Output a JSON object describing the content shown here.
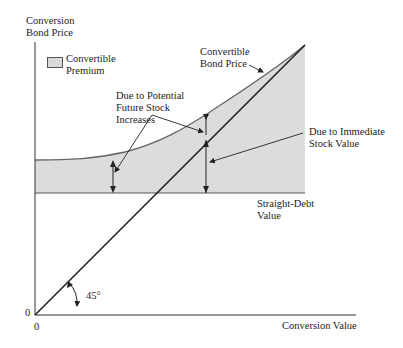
{
  "diagram": {
    "y_axis_label": [
      "Conversion",
      "Bond Price"
    ],
    "x_axis_label": "Conversion Value",
    "origin_y_label": "0",
    "origin_x_label": "0",
    "legend": {
      "swatch_color": "#d9d9d9",
      "label": [
        "Convertible",
        "Premium"
      ]
    },
    "annotations": {
      "bond_price": [
        "Convertible",
        "Bond Price"
      ],
      "future_stock": [
        "Due to Potential",
        "Future Stock",
        "Increases"
      ],
      "immediate_stock": [
        "Due to Immediate",
        "Stock Value"
      ],
      "straight_debt": [
        "Straight-Debt",
        "Value"
      ],
      "angle": "45°"
    },
    "colors": {
      "shading": "#dcdcdc",
      "curve": "#666666",
      "line": "#222222",
      "axis": "#333333"
    }
  }
}
